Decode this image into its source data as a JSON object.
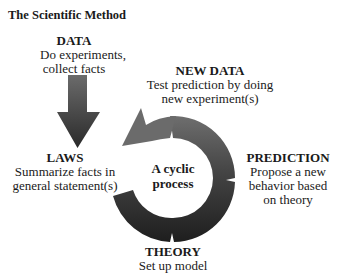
{
  "title": "The Scientific Method",
  "center_label": {
    "line1": "A cyclic",
    "line2": "process"
  },
  "nodes": {
    "data": {
      "heading": "DATA",
      "lines": [
        "Do experiments,",
        "collect facts"
      ]
    },
    "new_data": {
      "heading": "NEW DATA",
      "lines": [
        "Test prediction by doing",
        "new experiment(s)"
      ]
    },
    "laws": {
      "heading": "LAWS",
      "lines": [
        "Summarize facts in",
        "general statement(s)"
      ]
    },
    "prediction": {
      "heading": "PREDICTION",
      "lines": [
        "Propose a new",
        "behavior based",
        "on theory"
      ]
    },
    "theory": {
      "heading": "THEORY",
      "lines": [
        "Set up model"
      ]
    }
  },
  "colors": {
    "arrow_light": "#6b6b6b",
    "arrow_dark": "#222222",
    "text": "#1a1a1a"
  }
}
